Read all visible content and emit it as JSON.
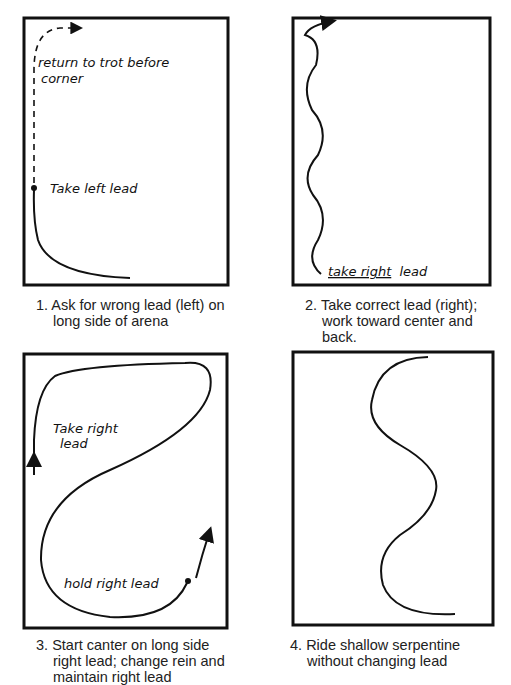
{
  "panels": [
    {
      "number": "1.",
      "caption_lines": [
        "Ask for wrong lead (left) on",
        "long side of arena"
      ],
      "annotations": [
        "return to trot before",
        "corner",
        "Take left lead"
      ]
    },
    {
      "number": "2.",
      "caption_lines": [
        "Take correct lead (right);",
        "work toward center and back."
      ],
      "annotations": [
        "take right",
        "lead"
      ]
    },
    {
      "number": "3.",
      "caption_lines": [
        "Start canter on long side",
        "right lead; change rein and",
        "maintain right lead"
      ],
      "annotations": [
        "Take right",
        "lead",
        "hold right lead"
      ]
    },
    {
      "number": "4.",
      "caption_lines": [
        "Ride shallow serpentine",
        "without changing lead"
      ],
      "annotations": []
    }
  ]
}
